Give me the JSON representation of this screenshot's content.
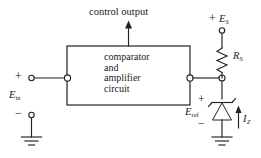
{
  "diagram": {
    "title": "control output",
    "block": {
      "name": "comparator-amplifier-block",
      "lines": [
        "comparator",
        "and",
        "amplifier",
        "circuit"
      ]
    },
    "input": {
      "plus_sign": "+",
      "minus_sign": "−",
      "label_symbol": "E",
      "label_subscript": "in"
    },
    "supply": {
      "plus_sign": "+",
      "label_symbol": "E",
      "label_subscript": "S"
    },
    "resistor": {
      "label_symbol": "R",
      "label_subscript": "S"
    },
    "zener": {
      "plus_sign": "+",
      "minus_sign": "−",
      "label_symbol": "E",
      "label_subscript": "ref",
      "current_symbol": "I",
      "current_subscript": "Z"
    },
    "icons": {
      "ground_left": "ground-icon",
      "ground_right": "ground-icon",
      "zener_diode": "zener-diode-icon",
      "resistor": "resistor-icon",
      "arrow_output": "arrow-up-icon",
      "arrow_current": "arrow-up-icon"
    },
    "colors": {
      "line": "#222222",
      "background": "#ffffff",
      "text": "#1a1a1a"
    }
  }
}
